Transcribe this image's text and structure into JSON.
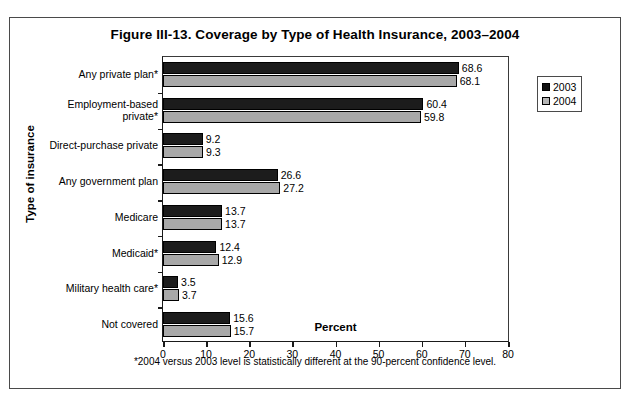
{
  "figure": {
    "title": "Figure III-13. Coverage by Type of Health Insurance, 2003–2004",
    "x_axis_title": "Percent",
    "y_axis_title": "Type of insurance",
    "footnote": "*2004 versus 2003 level is statistically different at the 90-percent confidence level."
  },
  "legend": {
    "items": [
      {
        "label": "2003",
        "color": "#111111"
      },
      {
        "label": "2004",
        "color": "#b5b5b5"
      }
    ]
  },
  "chart_data": {
    "type": "bar",
    "orientation": "horizontal",
    "title": "Figure III-13. Coverage by Type of Health Insurance, 2003–2004",
    "xlabel": "Percent",
    "ylabel": "Type of insurance",
    "xlim": [
      0,
      80
    ],
    "xticks": [
      0,
      10,
      20,
      30,
      40,
      50,
      60,
      70,
      80
    ],
    "grid": false,
    "legend_position": "right-outside",
    "annotation": "*2004 versus 2003 level is statistically different at the 90-percent confidence level.",
    "categories": [
      "Any private plan*",
      "Employment-based private*",
      "Direct-purchase private",
      "Any government plan",
      "Medicare",
      "Medicaid*",
      "Military health care*",
      "Not covered"
    ],
    "series": [
      {
        "name": "2003",
        "color": "#1c1c1c",
        "values": [
          68.6,
          60.4,
          9.2,
          26.6,
          13.7,
          12.4,
          3.5,
          15.6
        ]
      },
      {
        "name": "2004",
        "color": "#a8a8a8",
        "values": [
          68.1,
          59.8,
          9.3,
          27.2,
          13.7,
          12.9,
          3.7,
          15.7
        ]
      }
    ],
    "value_labels": [
      {
        "category": "Any private plan*",
        "v2003": "68.6",
        "v2004": "68.1"
      },
      {
        "category": "Employment-based private*",
        "v2003": "60.4",
        "v2004": "59.8"
      },
      {
        "category": "Direct-purchase private",
        "v2003": "9.2",
        "v2004": "9.3"
      },
      {
        "category": "Any government plan",
        "v2003": "26.6",
        "v2004": "27.2"
      },
      {
        "category": "Medicare",
        "v2003": "13.7",
        "v2004": "13.7"
      },
      {
        "category": "Medicaid*",
        "v2003": "12.4",
        "v2004": "12.9"
      },
      {
        "category": "Military health care*",
        "v2003": "3.5",
        "v2004": "3.7"
      },
      {
        "category": "Not covered",
        "v2003": "15.6",
        "v2004": "15.7"
      }
    ]
  }
}
